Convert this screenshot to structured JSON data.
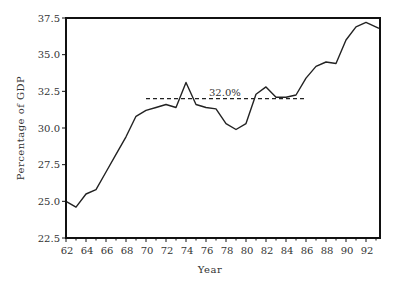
{
  "chart_data": {
    "type": "line",
    "title": "",
    "xlabel": "Year",
    "ylabel": "Percentage of GDP",
    "xlim": [
      62,
      93.4
    ],
    "ylim": [
      22.5,
      37.5
    ],
    "grid": false,
    "legend": null,
    "x_ticks": [
      "62",
      "64",
      "66",
      "68",
      "70",
      "72",
      "74",
      "76",
      "78",
      "80",
      "82",
      "84",
      "86",
      "88",
      "90",
      "92"
    ],
    "y_ticks": [
      "22.5",
      "25.0",
      "27.5",
      "30.0",
      "32.5",
      "35.0",
      "37.5"
    ],
    "series": [
      {
        "name": "Percentage of GDP",
        "x": [
          62,
          63,
          64,
          65,
          66,
          67,
          68,
          69,
          70,
          71,
          72,
          73,
          74,
          75,
          76,
          77,
          78,
          79,
          80,
          81,
          82,
          83,
          84,
          85,
          86,
          87,
          88,
          89,
          90,
          91,
          92,
          93.3
        ],
        "values": [
          25.0,
          24.6,
          25.5,
          25.8,
          27.0,
          28.2,
          29.4,
          30.8,
          31.2,
          31.4,
          31.6,
          31.4,
          33.1,
          31.6,
          31.4,
          31.3,
          30.3,
          29.9,
          30.3,
          32.3,
          32.8,
          32.1,
          32.1,
          32.25,
          33.4,
          34.2,
          34.5,
          34.4,
          36.0,
          36.9,
          37.2,
          36.8
        ]
      }
    ],
    "annotations": [
      {
        "type": "hline",
        "y": 32.0,
        "x_from": 70,
        "x_to": 85.9,
        "style": "dashed",
        "label": "32.0%"
      }
    ]
  },
  "labels": {
    "xlabel": "Year",
    "ylabel": "Percentage of GDP",
    "avg_label": "32.0%"
  }
}
